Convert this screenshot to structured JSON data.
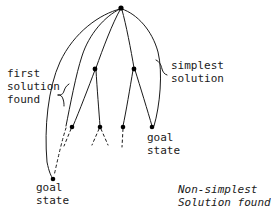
{
  "diagram": {
    "stroke_color": "#1a1a1a",
    "node_color": "#000000",
    "background": "#ffffff",
    "labels": {
      "first_solution_found": "first\nsolution\nfound",
      "simplest_solution": "simplest\nsolution",
      "goal_state_right": "goal\nstate",
      "goal_state_bottom": "goal\nstate",
      "non_simplest_solution_found": "Non-simplest\nSolution found"
    },
    "nodes": [
      {
        "id": "root",
        "x": 121,
        "y": 8,
        "name": "root-node"
      },
      {
        "id": "mid-l",
        "x": 95,
        "y": 69,
        "name": "intermediate-node-left"
      },
      {
        "id": "mid-r",
        "x": 134,
        "y": 69,
        "name": "intermediate-node-right"
      },
      {
        "id": "leaf-1",
        "x": 72,
        "y": 127,
        "name": "leaf-node-1"
      },
      {
        "id": "leaf-2",
        "x": 100,
        "y": 127,
        "name": "leaf-node-2"
      },
      {
        "id": "leaf-3",
        "x": 123,
        "y": 127,
        "name": "leaf-node-3"
      },
      {
        "id": "leaf-4",
        "x": 152,
        "y": 127,
        "name": "goal-node-right"
      },
      {
        "id": "deep",
        "x": 53,
        "y": 179,
        "name": "goal-node-bottom"
      }
    ]
  }
}
